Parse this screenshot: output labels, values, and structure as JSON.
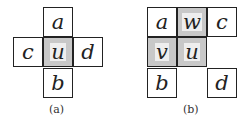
{
  "figure_a": {
    "cells": {
      "top": "a",
      "left": "c",
      "center": "u",
      "right": "d",
      "bottom": "b"
    },
    "caption": "(a)"
  },
  "figure_b": {
    "cells": {
      "r1c1": "a",
      "r1c2": "w",
      "r1c3": "c",
      "r2c1": "v",
      "r2c2": "u",
      "r3c1": "b",
      "r3c3": "d"
    },
    "caption": "(b)"
  },
  "colors": {
    "border": "#222222",
    "shade": "#c8c8c8"
  }
}
